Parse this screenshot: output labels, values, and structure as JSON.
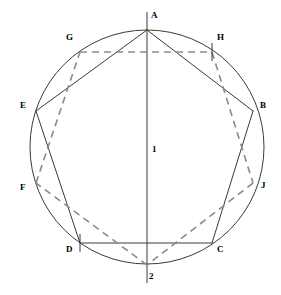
{
  "figure": {
    "background_color": "#ffffff",
    "stroke_color": "#3a3a3a",
    "dash_color": "#8a8a8a",
    "label_color": "#000000"
  },
  "chart_data": {
    "type": "diagram",
    "title": "",
    "subtitle": "",
    "xlabel": "",
    "ylabel": "",
    "grid": false,
    "legend": null,
    "circle": {
      "center_x": 147,
      "center_y": 147,
      "radius": 117
    },
    "points": [
      {
        "id": "A",
        "label": "A",
        "x": 147,
        "y": 30,
        "label_dx": 4,
        "label_dy": -14,
        "tick": "none"
      },
      {
        "id": "G",
        "label": "G",
        "x": 80,
        "y": 52,
        "label_dx": -14,
        "label_dy": -14,
        "tick": "none"
      },
      {
        "id": "H",
        "label": "H",
        "x": 212,
        "y": 52,
        "label_dx": 5,
        "label_dy": -14,
        "tick": "vertical"
      },
      {
        "id": "E",
        "label": "E",
        "x": 36,
        "y": 111,
        "label_dx": -16,
        "label_dy": -5,
        "tick": "none"
      },
      {
        "id": "B",
        "label": "B",
        "x": 253,
        "y": 111,
        "label_dx": 7,
        "label_dy": -5,
        "tick": "none"
      },
      {
        "id": "F",
        "label": "F",
        "x": 36,
        "y": 183,
        "label_dx": -16,
        "label_dy": 5,
        "tick": "none"
      },
      {
        "id": "J",
        "label": "J",
        "x": 253,
        "y": 183,
        "label_dx": 8,
        "label_dy": 3,
        "tick": "none"
      },
      {
        "id": "D",
        "label": "D",
        "x": 80,
        "y": 243,
        "label_dx": -14,
        "label_dy": 7,
        "tick": "vertical"
      },
      {
        "id": "C",
        "label": "C",
        "x": 212,
        "y": 243,
        "label_dx": 5,
        "label_dy": 7,
        "tick": "none"
      },
      {
        "id": "2",
        "label": "2",
        "x": 147,
        "y": 265,
        "label_dx": 2,
        "label_dy": 12,
        "tick": "none"
      }
    ],
    "center_labels": [
      {
        "id": "1",
        "label": "1",
        "x": 152,
        "y": 150
      }
    ],
    "solid_edges": [
      [
        "A",
        "B"
      ],
      [
        "B",
        "C"
      ],
      [
        "C",
        "D"
      ],
      [
        "D",
        "E"
      ],
      [
        "E",
        "A"
      ]
    ],
    "dashed_edges": [
      [
        "G",
        "H"
      ],
      [
        "H",
        "J"
      ],
      [
        "J",
        "2"
      ],
      [
        "2",
        "F"
      ],
      [
        "F",
        "G"
      ]
    ],
    "axis_line": {
      "id": "vertical-diameter",
      "x1": 147,
      "y1": 12,
      "x2": 147,
      "y2": 283
    }
  }
}
